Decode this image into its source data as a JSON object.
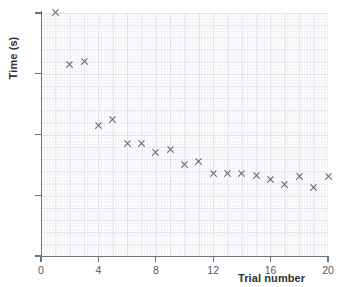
{
  "chart_data": {
    "type": "scatter",
    "title": "",
    "xlabel": "Trial number",
    "ylabel": "Time (s)",
    "xlim": [
      0,
      20
    ],
    "ylim": [
      0,
      80
    ],
    "grid": true,
    "legend": "none",
    "xticks": [
      "0",
      "4",
      "8",
      "12",
      "16",
      "20"
    ],
    "xtick_values": [
      0,
      4,
      8,
      12,
      16,
      20
    ],
    "yticks": [
      "0",
      "20",
      "40",
      "60",
      "80"
    ],
    "ytick_values": [
      0,
      20,
      40,
      60,
      80
    ],
    "marker": "x",
    "marker_color": "#5c6168",
    "grid_color": "#dfe3ea",
    "axis_color": "#6e7276",
    "x": [
      1,
      2,
      3,
      4,
      5,
      6,
      7,
      8,
      9,
      10,
      11,
      12,
      13,
      14,
      15,
      16,
      17,
      18,
      19,
      20
    ],
    "y": [
      80,
      63,
      64,
      43,
      45,
      37,
      37,
      34,
      35,
      30,
      31,
      27,
      27,
      27,
      26.5,
      25,
      23.5,
      26,
      22.5,
      26
    ],
    "points": [
      {
        "x": 1,
        "y": 80
      },
      {
        "x": 2,
        "y": 63
      },
      {
        "x": 3,
        "y": 64
      },
      {
        "x": 4,
        "y": 43
      },
      {
        "x": 5,
        "y": 45
      },
      {
        "x": 6,
        "y": 37
      },
      {
        "x": 7,
        "y": 37
      },
      {
        "x": 8,
        "y": 34
      },
      {
        "x": 9,
        "y": 35
      },
      {
        "x": 10,
        "y": 30
      },
      {
        "x": 11,
        "y": 31
      },
      {
        "x": 12,
        "y": 27
      },
      {
        "x": 13,
        "y": 27
      },
      {
        "x": 14,
        "y": 27
      },
      {
        "x": 15,
        "y": 26.5
      },
      {
        "x": 16,
        "y": 25
      },
      {
        "x": 17,
        "y": 23.5
      },
      {
        "x": 18,
        "y": 26
      },
      {
        "x": 19,
        "y": 22.5
      },
      {
        "x": 20,
        "y": 26
      }
    ]
  }
}
